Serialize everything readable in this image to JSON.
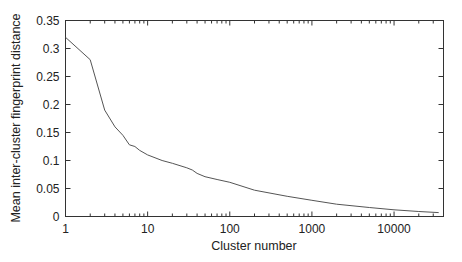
{
  "chart_data": {
    "type": "line",
    "title": "",
    "xlabel": "Cluster number",
    "ylabel": "Mean inter-cluster fingerprint distance",
    "xscale": "log",
    "xlim": [
      1,
      40000
    ],
    "ylim": [
      0,
      0.35
    ],
    "grid": false,
    "legend": null,
    "x_ticks": [
      1,
      10,
      100,
      1000,
      10000
    ],
    "x_tick_labels": [
      "1",
      "10",
      "100",
      "1000",
      "10000"
    ],
    "y_ticks": [
      0,
      0.05,
      0.1,
      0.15,
      0.2,
      0.25,
      0.3,
      0.35
    ],
    "y_tick_labels": [
      "0",
      "0.05",
      "0.1",
      "0.15",
      "0.2",
      "0.25",
      "0.3",
      "0.35"
    ],
    "series": [
      {
        "name": "mean distance",
        "color": "#555555",
        "x": [
          1,
          2,
          3,
          4,
          5,
          6,
          7,
          8,
          10,
          15,
          20,
          30,
          35,
          40,
          50,
          70,
          100,
          200,
          500,
          1000,
          2000,
          5000,
          10000,
          20000,
          35000
        ],
        "y": [
          0.32,
          0.28,
          0.19,
          0.16,
          0.145,
          0.128,
          0.125,
          0.118,
          0.11,
          0.1,
          0.095,
          0.087,
          0.083,
          0.077,
          0.071,
          0.066,
          0.061,
          0.047,
          0.036,
          0.029,
          0.022,
          0.016,
          0.012,
          0.009,
          0.007
        ]
      }
    ]
  }
}
